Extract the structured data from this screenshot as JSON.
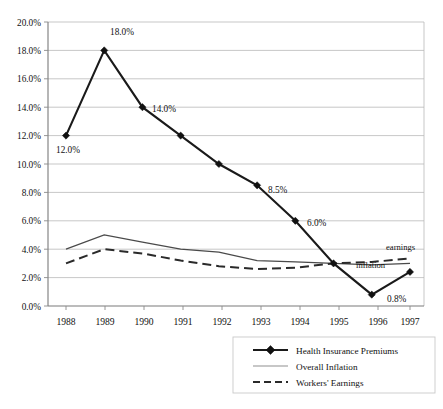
{
  "chart_data": {
    "type": "line",
    "title": "",
    "xlabel": "",
    "ylabel": "",
    "categories": [
      "1988",
      "1989",
      "1990",
      "1991",
      "1992",
      "1993",
      "1994",
      "1995",
      "1996",
      "1997"
    ],
    "ylim": [
      0,
      20
    ],
    "ytick_labels": [
      "0.0%",
      "2.0%",
      "4.0%",
      "6.0%",
      "8.0%",
      "10.0%",
      "12.0%",
      "14.0%",
      "16.0%",
      "18.0%",
      "20.0%"
    ],
    "ytick_values": [
      0,
      2,
      4,
      6,
      8,
      10,
      12,
      14,
      16,
      18,
      20
    ],
    "grid": true,
    "legend_position": "bottom-right",
    "series": [
      {
        "name": "Health Insurance Premiums",
        "style": "solid-thick-diamond",
        "color": "#1a1a1a",
        "values": [
          12.0,
          18.0,
          14.0,
          12.0,
          10.0,
          8.5,
          6.0,
          3.0,
          0.8,
          2.4
        ],
        "point_labels": [
          "12.0%",
          "18.0%",
          "14.0%",
          "",
          "",
          "8.5%",
          "6.0%",
          "",
          "0.8%",
          ""
        ]
      },
      {
        "name": "Overall Inflation",
        "style": "solid-thin",
        "color": "#4a4a4a",
        "values": [
          4.0,
          5.0,
          4.5,
          4.0,
          3.8,
          3.2,
          3.1,
          3.0,
          2.9,
          3.0
        ]
      },
      {
        "name": "Workers' Earnings",
        "style": "dashed",
        "color": "#2a2a2a",
        "values": [
          3.0,
          4.0,
          3.7,
          3.2,
          2.8,
          2.6,
          2.7,
          3.0,
          3.1,
          3.35
        ]
      }
    ],
    "annotations": [
      {
        "text": "earnings",
        "near": "Workers' Earnings",
        "x_year": "1997"
      },
      {
        "text": "inflation",
        "near": "Overall Inflation",
        "x_year": "1996"
      }
    ]
  },
  "axis": {
    "y_labels": [
      "20.0%",
      "18.0%",
      "16.0%",
      "14.0%",
      "12.0%",
      "10.0%",
      "8.0%",
      "6.0%",
      "4.0%",
      "2.0%",
      "0.0%"
    ],
    "x_labels": [
      "1988",
      "1989",
      "1990",
      "1991",
      "1992",
      "1993",
      "1994",
      "1995",
      "1996",
      "1997"
    ]
  },
  "data_labels": {
    "p1988": "12.0%",
    "p1989": "18.0%",
    "p1990": "14.0%",
    "p1993": "8.5%",
    "p1994": "6.0%",
    "p1996": "0.8%"
  },
  "annotations": {
    "earnings": "earnings",
    "inflation": "inflation"
  },
  "legend": {
    "items": [
      {
        "label": "Health Insurance Premiums",
        "style": "solid-thick-diamond"
      },
      {
        "label": "Overall Inflation",
        "style": "solid-thin"
      },
      {
        "label": "Workers' Earnings",
        "style": "dashed"
      }
    ]
  }
}
